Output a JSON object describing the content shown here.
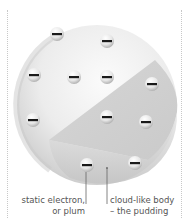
{
  "diagram": {
    "labels": {
      "electron": {
        "line1": "static electron,",
        "line2": "or plum"
      },
      "body": {
        "line1": "cloud-like body",
        "line2": "– the pudding"
      }
    },
    "electron_symbol": "−",
    "electron_count": 11,
    "colors": {
      "sphere_light": "#f4f4f4",
      "sphere_mid": "#d9d9d9",
      "sphere_dark": "#b8b8b8",
      "cut_face": "#cfcfcf",
      "electron_mark": "#1a1a1a",
      "label_text": "#555555",
      "leader_line": "#666666"
    }
  }
}
